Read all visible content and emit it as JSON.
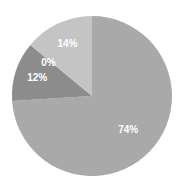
{
  "chart_data": {
    "type": "pie",
    "title": "",
    "start_angle_deg": 0,
    "direction": "clockwise",
    "slices": [
      {
        "label": "74%",
        "value": 74,
        "color": "#a9a9a9"
      },
      {
        "label": "12%",
        "value": 12,
        "color": "#8c8c8c"
      },
      {
        "label": "0%",
        "value": 0,
        "color": "#9a9a9a"
      },
      {
        "label": "14%",
        "value": 14,
        "color": "#c4c4c4"
      }
    ],
    "legend": "none"
  }
}
